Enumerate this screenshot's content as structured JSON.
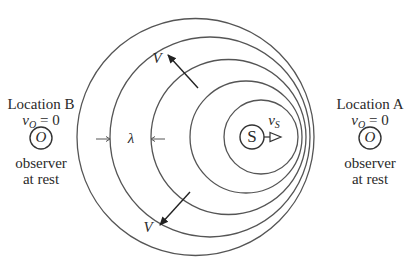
{
  "diagram": {
    "type": "doppler-effect-wavefronts",
    "source": {
      "label": "S",
      "velocity_label": "v",
      "velocity_subscript": "S",
      "center": [
        252,
        137
      ],
      "radius": 12
    },
    "wavefronts": [
      {
        "cx": 261,
        "cy": 137,
        "r": 37
      },
      {
        "cx": 246,
        "cy": 137,
        "r": 56
      },
      {
        "cx": 228.5,
        "cy": 137,
        "r": 77.5
      },
      {
        "cx": 210,
        "cy": 137,
        "r": 100
      },
      {
        "cx": 195.5,
        "cy": 137,
        "r": 118.5
      }
    ],
    "wave_velocity_label": "V",
    "wavelength_label": "λ",
    "stroke_color": "#555555"
  },
  "location_b": {
    "title": "Location B",
    "velocity_var": "v",
    "velocity_sub": "O",
    "velocity_eq": " = 0",
    "symbol": "O",
    "caption_line1": "observer",
    "caption_line2": "at rest"
  },
  "location_a": {
    "title": "Location A",
    "velocity_var": "v",
    "velocity_sub": "O",
    "velocity_eq": " = 0",
    "symbol": "O",
    "caption_line1": "observer",
    "caption_line2": "at rest"
  }
}
